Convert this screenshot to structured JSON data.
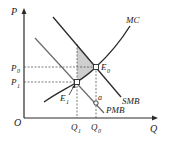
{
  "diagram": {
    "type": "economics-externality",
    "axes": {
      "y_label": "P",
      "x_label": "Q",
      "origin_label": "O"
    },
    "price_labels": {
      "p0": "P",
      "p0_sub": "0",
      "p1": "P",
      "p1_sub": "1"
    },
    "quantity_labels": {
      "q1": "Q",
      "q1_sub": "1",
      "q0": "Q",
      "q0_sub": "0"
    },
    "curves": {
      "mc": "MC",
      "smb": "SMB",
      "pmb": "PMB"
    },
    "points": {
      "e0": "E",
      "e0_sub": "0",
      "e1": "E",
      "e1_sub": "1",
      "a": "a"
    },
    "colors": {
      "line": "#2a2a2a",
      "curve_light": "#6a6a6a",
      "shade": "#cfcfcf",
      "dashed": "#444444"
    }
  }
}
